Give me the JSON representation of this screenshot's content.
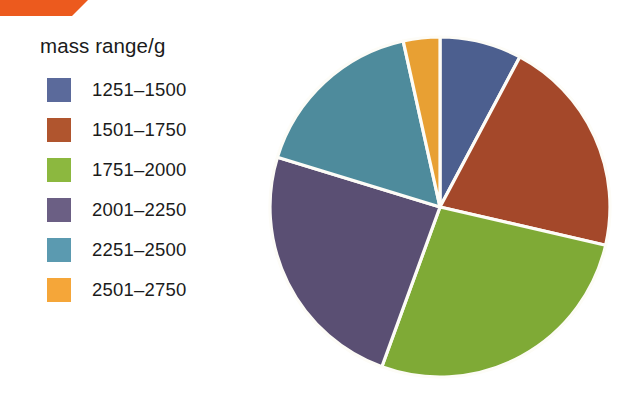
{
  "figure": {
    "legend_title": "mass range/g",
    "banner_color": "#ec5a1e",
    "slice_outline_color": "#fdfcf7"
  },
  "legend": {
    "items": [
      {
        "label": "1251–1500",
        "color": "#5b6a9b"
      },
      {
        "label": "1501–1750",
        "color": "#b0552e"
      },
      {
        "label": "1751–2000",
        "color": "#8cb83f"
      },
      {
        "label": "2001–2250",
        "color": "#6b5f84"
      },
      {
        "label": "2251–2500",
        "color": "#5b9ab0"
      },
      {
        "label": "2501–2750",
        "color": "#f5a639"
      }
    ]
  },
  "chart_data": {
    "type": "pie",
    "title": "",
    "legend_title": "mass range/g",
    "legend_position": "left",
    "start_angle_deg": 0,
    "direction": "clockwise",
    "categories": [
      "1251–1500",
      "1501–1750",
      "1751–2000",
      "2001–2250",
      "2251–2500",
      "2501–2750"
    ],
    "values": [
      7.8,
      20.8,
      27.0,
      24.2,
      16.8,
      3.5
    ],
    "value_unit": "percent",
    "angles_deg": [
      28,
      75,
      97,
      87,
      60.5,
      12.5
    ],
    "boundaries_deg": [
      0,
      28,
      103,
      200,
      287,
      347.5,
      360
    ],
    "colors": [
      "#4c5f8f",
      "#a4482a",
      "#7faa36",
      "#5a4f73",
      "#4e8b9c",
      "#e8a033"
    ],
    "xlabel": "",
    "ylabel": "",
    "grid": false
  }
}
